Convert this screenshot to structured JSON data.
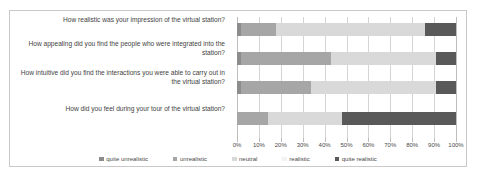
{
  "chart_data": {
    "type": "bar",
    "orientation": "horizontal",
    "stacked": true,
    "stack_mode": "percent",
    "title": "",
    "xlabel": "",
    "ylabel": "",
    "xlim": [
      0,
      100
    ],
    "grid": true,
    "legend_position": "bottom",
    "xticklabels": [
      "0%",
      "10%",
      "20%",
      "30%",
      "40%",
      "50%",
      "60%",
      "70%",
      "80%",
      "90%",
      "100%"
    ],
    "xticks": [
      0,
      10,
      20,
      30,
      40,
      50,
      60,
      70,
      80,
      90,
      100
    ],
    "categories": [
      "How realistic was your impression of the virtual station?",
      "How appealing did you find the people who were integrated into the station?",
      "How intuitive did you find the interactions you were able to carry out in the virtual station?",
      "How did you feel during your tour of the virtual station?"
    ],
    "series": [
      {
        "name": "quite unrealistic",
        "color": "#8c8c8c",
        "values": [
          2,
          2,
          2,
          0
        ]
      },
      {
        "name": "unrealistic",
        "color": "#a6a6a6",
        "values": [
          16,
          41,
          32,
          14
        ]
      },
      {
        "name": "neutral",
        "color": "#d9d9d9",
        "values": [
          68,
          48,
          57,
          34
        ]
      },
      {
        "name": "realistic",
        "color": "#f2f2f2",
        "values": [
          0,
          0,
          0,
          0
        ]
      },
      {
        "name": "quite realistic",
        "color": "#595959",
        "values": [
          14,
          9,
          9,
          52
        ]
      }
    ]
  },
  "legend": {
    "items": [
      {
        "label": "quite unrealistic",
        "color": "#8c8c8c"
      },
      {
        "label": "unrealistic",
        "color": "#a6a6a6"
      },
      {
        "label": "neutral",
        "color": "#d9d9d9"
      },
      {
        "label": "realistic",
        "color": "#f2f2f2"
      },
      {
        "label": "quite realistic",
        "color": "#595959"
      }
    ]
  }
}
